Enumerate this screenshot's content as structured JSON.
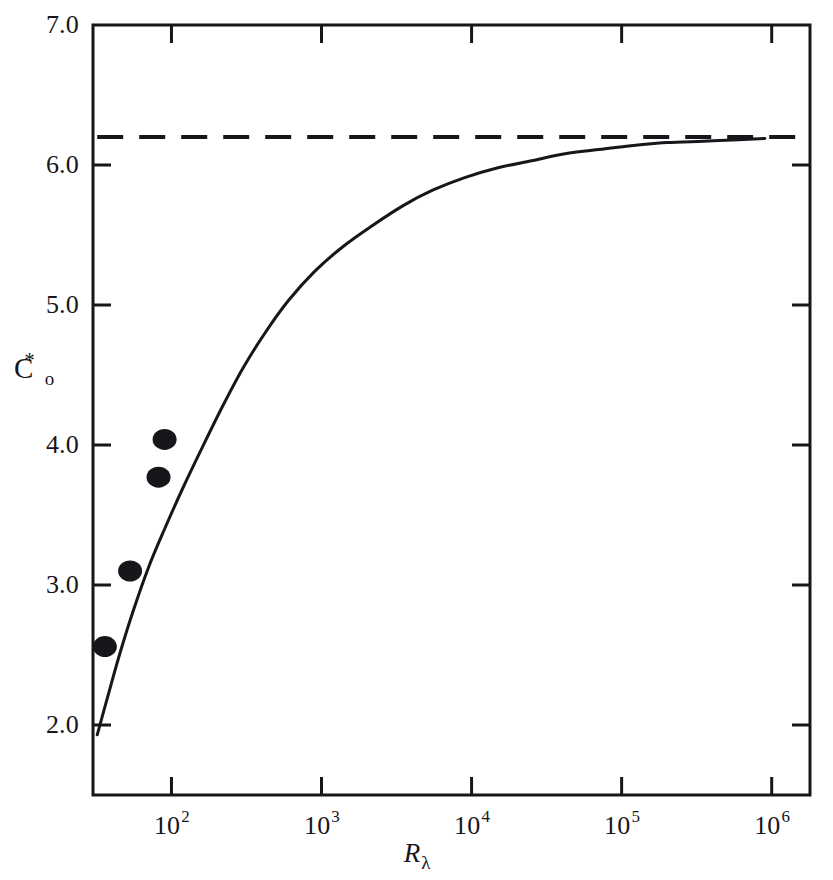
{
  "figure": {
    "background_color": "#ffffff",
    "ink_color": "#17161a"
  },
  "axes": {
    "y_title_symbol": "C",
    "y_title_subscript": "o",
    "y_title_superscript": "*",
    "x_title_symbol": "R",
    "x_title_subscript": "λ"
  },
  "chart_data": {
    "type": "line",
    "title": "",
    "xlabel": "R_lambda",
    "ylabel": "C_o^*",
    "xscale": "log",
    "yscale": "linear",
    "xlim": [
      30,
      1800000
    ],
    "ylim": [
      1.5,
      7.0
    ],
    "grid": false,
    "legend": "none",
    "x_tick_labels": [
      "10²",
      "10³",
      "10⁴",
      "10⁵",
      "10⁶"
    ],
    "x_tick_bases": [
      "10",
      "10",
      "10",
      "10",
      "10"
    ],
    "x_tick_exponents": [
      "2",
      "3",
      "4",
      "5",
      "6"
    ],
    "x_tick_values": [
      100,
      1000,
      10000,
      100000,
      1000000
    ],
    "y_tick_labels": [
      "2.0",
      "3.0",
      "4.0",
      "5.0",
      "6.0",
      "7.0"
    ],
    "y_tick_values": [
      2.0,
      3.0,
      4.0,
      5.0,
      6.0,
      7.0
    ],
    "series": [
      {
        "name": "model-curve",
        "style": "solid-line",
        "x": [
          32,
          38,
          45,
          55,
          70,
          90,
          120,
          160,
          220,
          300,
          420,
          600,
          900,
          1400,
          2200,
          3500,
          5500,
          9000,
          15000,
          25000,
          42000,
          70000,
          120000,
          200000,
          350000,
          600000,
          900000
        ],
        "y": [
          1.93,
          2.22,
          2.5,
          2.8,
          3.12,
          3.4,
          3.7,
          3.98,
          4.28,
          4.55,
          4.8,
          5.03,
          5.24,
          5.42,
          5.57,
          5.71,
          5.82,
          5.91,
          5.98,
          6.03,
          6.08,
          6.11,
          6.14,
          6.16,
          6.17,
          6.18,
          6.19
        ]
      },
      {
        "name": "asymptote",
        "style": "dashed-line",
        "value": 6.2,
        "x_start": 32,
        "x_end": 1550000
      },
      {
        "name": "experimental-points",
        "style": "filled-circles",
        "points": [
          {
            "x": 36,
            "y": 2.56
          },
          {
            "x": 53,
            "y": 3.1
          },
          {
            "x": 82,
            "y": 3.77
          },
          {
            "x": 90,
            "y": 4.04
          }
        ]
      }
    ]
  }
}
